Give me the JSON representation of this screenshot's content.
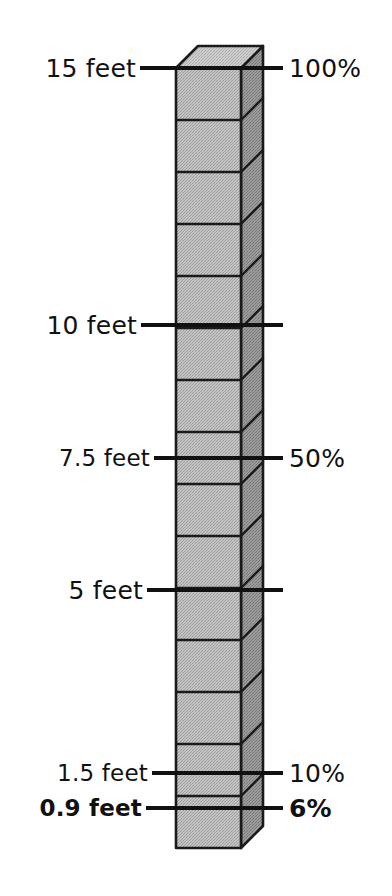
{
  "figure": {
    "colors": {
      "background": "#ffffff",
      "ink": "#111111",
      "front_face": "#b4b4b4",
      "side_face": "#8e8e8e",
      "top_face": "#c8c8c8",
      "outline": "#1a1a1a"
    },
    "column": {
      "unit_label": "cube",
      "total_feet": 15,
      "total_percent": 100,
      "block_count": 15,
      "geometry": {
        "front_left_x": 176,
        "front_right_x": 241,
        "side_right_x": 263,
        "depth_rise": 22,
        "top_y": 68,
        "bottom_y": 848
      }
    },
    "markings": [
      {
        "id": "mark-15-feet",
        "feet_label": "15 feet",
        "percent_label": "100%",
        "feet_value": 15,
        "percent_value": 100,
        "y": 68,
        "feet_bold": false,
        "percent_bold": false,
        "has_percent": true,
        "line_left_x": 140,
        "line_right_x": 283
      },
      {
        "id": "mark-10-feet",
        "feet_label": "10 feet",
        "percent_label": "",
        "feet_value": 10,
        "percent_value": null,
        "y": 325,
        "feet_bold": false,
        "percent_bold": false,
        "has_percent": false,
        "line_left_x": 141,
        "line_right_x": 283
      },
      {
        "id": "mark-7-5-feet",
        "feet_label": "7.5 feet",
        "percent_label": "50%",
        "feet_value": 7.5,
        "percent_value": 50,
        "y": 458,
        "feet_bold": false,
        "percent_bold": false,
        "has_percent": true,
        "line_left_x": 154,
        "line_right_x": 283
      },
      {
        "id": "mark-5-feet",
        "feet_label": "5 feet",
        "percent_label": "",
        "feet_value": 5,
        "percent_value": null,
        "y": 590,
        "feet_bold": false,
        "percent_bold": false,
        "has_percent": false,
        "line_left_x": 147,
        "line_right_x": 283
      },
      {
        "id": "mark-1-5-feet",
        "feet_label": "1.5 feet",
        "percent_label": "10%",
        "feet_value": 1.5,
        "percent_value": 10,
        "y": 773,
        "feet_bold": false,
        "percent_bold": false,
        "has_percent": true,
        "line_left_x": 152,
        "line_right_x": 283
      },
      {
        "id": "mark-0-9-feet",
        "feet_label": "0.9 feet",
        "percent_label": "6%",
        "feet_value": 0.9,
        "percent_value": 6,
        "y": 808,
        "feet_bold": true,
        "percent_bold": true,
        "has_percent": true,
        "line_left_x": 146,
        "line_right_x": 283
      }
    ]
  },
  "chart_data": {
    "type": "bar",
    "orientation": "vertical",
    "categories": [
      "15 feet",
      "10 feet",
      "7.5 feet",
      "5 feet",
      "1.5 feet",
      "0.9 feet"
    ],
    "series": [
      {
        "name": "Height (feet)",
        "values": [
          15,
          10,
          7.5,
          5,
          1.5,
          0.9
        ]
      },
      {
        "name": "Percent of total",
        "values": [
          100,
          null,
          50,
          null,
          10,
          6
        ]
      }
    ],
    "ylabel": "feet",
    "y2label": "percent",
    "ylim": [
      0,
      15
    ],
    "y2lim": [
      0,
      100
    ],
    "grid": false,
    "legend": "none",
    "annotations": [
      "15 feet = 100%",
      "10 feet",
      "7.5 feet = 50%",
      "5 feet",
      "1.5 feet = 10%",
      "0.9 feet = 6%"
    ],
    "block_count": 15
  }
}
